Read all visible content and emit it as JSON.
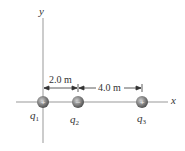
{
  "diagram": {
    "axes": {
      "x_label": "x",
      "y_label": "y"
    },
    "dimensions": [
      {
        "label": "2.0 m",
        "from": "q1",
        "to": "q2"
      },
      {
        "label": "4.0 m",
        "from": "q2",
        "to": "q3"
      }
    ],
    "charges": [
      {
        "name": "q",
        "sub": "1",
        "sign": "+"
      },
      {
        "name": "q",
        "sub": "2",
        "sign": "−"
      },
      {
        "name": "q",
        "sub": "3",
        "sign": "+"
      }
    ],
    "colors": {
      "axis": "#888888",
      "charge": "#7a7a7a",
      "charge_dark": "#555555"
    }
  }
}
